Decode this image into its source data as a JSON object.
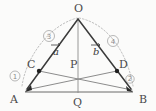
{
  "figure": {
    "background_color": "#fbfbfa",
    "line_color": "#3b3b3b",
    "accent_color": "#b0b0b0",
    "label_color": "#4a4a4a",
    "points": {
      "O": {
        "label": "O",
        "x": 78,
        "y": 18
      },
      "A": {
        "label": "A",
        "x": 25,
        "y": 92
      },
      "B": {
        "label": "B",
        "x": 133,
        "y": 92
      },
      "C": {
        "label": "C",
        "x": 39,
        "y": 71
      },
      "D": {
        "label": "D",
        "x": 117,
        "y": 71
      },
      "P": {
        "label": "P",
        "x": 78,
        "y": 70
      },
      "Q": {
        "label": "Q",
        "x": 78,
        "y": 92
      }
    },
    "vectors": [
      {
        "name": "a",
        "label": "a",
        "from": "O",
        "to": "C",
        "label_x": 57,
        "label_y": 50
      },
      {
        "name": "b",
        "label": "b",
        "from": "O",
        "to": "D",
        "label_x": 97,
        "label_y": 50
      }
    ],
    "circled_marks": [
      {
        "id": "mark-1",
        "label": "1",
        "glyph": "①",
        "x": 15,
        "y": 76,
        "r": 5
      },
      {
        "id": "mark-2",
        "label": "2",
        "glyph": "②",
        "x": 130,
        "y": 79,
        "r": 4
      },
      {
        "id": "mark-3",
        "label": "3",
        "glyph": "③",
        "x": 49,
        "y": 36,
        "r": 5.5
      },
      {
        "id": "mark-4",
        "label": "4",
        "glyph": "④",
        "x": 113,
        "y": 41,
        "r": 5.5
      }
    ],
    "segments": [
      {
        "name": "O-to-A-side",
        "from": "O",
        "to": "A",
        "style": "solid-main"
      },
      {
        "name": "O-to-B-side",
        "from": "O",
        "to": "B",
        "style": "solid-main"
      },
      {
        "name": "A-to-B-base",
        "from": "A",
        "to": "B",
        "style": "solid-base"
      },
      {
        "name": "A-to-D-cevian",
        "from": "A",
        "to": "D",
        "style": "solid-thin"
      },
      {
        "name": "B-to-C-cevian",
        "from": "B",
        "to": "C",
        "style": "solid-thin"
      },
      {
        "name": "O-to-Q-vertical",
        "from": "O",
        "to": "Q",
        "style": "vert-line"
      }
    ],
    "arcs": [
      {
        "name": "left-dotted-arc",
        "style": "dotted-arc"
      },
      {
        "name": "right-dotted-arc",
        "style": "dotted-arc"
      }
    ]
  }
}
